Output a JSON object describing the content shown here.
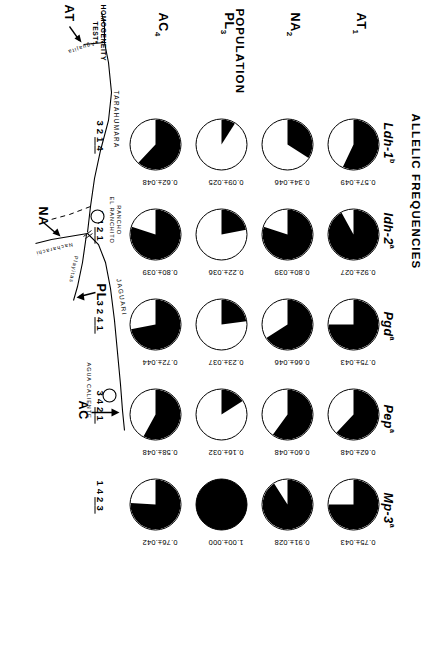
{
  "figure": {
    "allelic_title": "ALLELIC FREQUENCIES",
    "population_title": "POPULATION",
    "homogeneity_label_line1": "HOMOGENEITY",
    "homogeneity_label_line2": "TEST*"
  },
  "loci": [
    {
      "name": "Ldh-1",
      "sup": "b"
    },
    {
      "name": "Idh-2",
      "sup": "a"
    },
    {
      "name": "Pgd",
      "sup": "a"
    },
    {
      "name": "Pep",
      "sup": "a"
    },
    {
      "name": "Mp-3",
      "sup": "a"
    }
  ],
  "populations": [
    {
      "code": "AT",
      "sub": "1"
    },
    {
      "code": "NA",
      "sub": "2"
    },
    {
      "code": "PL",
      "sub": "3"
    },
    {
      "code": "AC",
      "sub": "4"
    }
  ],
  "chart_data": {
    "type": "pie",
    "title": "ALLELIC FREQUENCIES",
    "categories": [
      "Ldh-1 b",
      "Idh-2 a",
      "Pgd a",
      "Pep a",
      "Mp-3 a"
    ],
    "rows": [
      {
        "population": "AT1",
        "cells": [
          {
            "locus": "Ldh-1",
            "value": 0.57,
            "se": 0.049,
            "label": "0.57±.049"
          },
          {
            "locus": "Idh-2",
            "value": 0.92,
            "se": 0.027,
            "label": "0.92±.027"
          },
          {
            "locus": "Pgd",
            "value": 0.75,
            "se": 0.043,
            "label": "0.75±.043"
          },
          {
            "locus": "Pep",
            "value": 0.62,
            "se": 0.048,
            "label": "0.62±.048"
          },
          {
            "locus": "Mp-3",
            "value": 0.75,
            "se": 0.043,
            "label": "0.75±.043"
          }
        ]
      },
      {
        "population": "NA2",
        "cells": [
          {
            "locus": "Ldh-1",
            "value": 0.34,
            "se": 0.046,
            "label": "0.34±.046"
          },
          {
            "locus": "Idh-2",
            "value": 0.8,
            "se": 0.039,
            "label": "0.80±.039"
          },
          {
            "locus": "Pgd",
            "value": 0.66,
            "se": 0.046,
            "label": "0.66±.046"
          },
          {
            "locus": "Pep",
            "value": 0.6,
            "se": 0.048,
            "label": "0.60±.048"
          },
          {
            "locus": "Mp-3",
            "value": 0.91,
            "se": 0.028,
            "label": "0.91±.028"
          }
        ]
      },
      {
        "population": "PL3",
        "cells": [
          {
            "locus": "Ldh-1",
            "value": 0.09,
            "se": 0.025,
            "label": "0.09±.025"
          },
          {
            "locus": "Idh-2",
            "value": 0.22,
            "se": 0.036,
            "label": "0.22±.036"
          },
          {
            "locus": "Pgd",
            "value": 0.23,
            "se": 0.037,
            "label": "0.23±.037"
          },
          {
            "locus": "Pep",
            "value": 0.16,
            "se": 0.032,
            "label": "0.16±.032"
          },
          {
            "locus": "Mp-3",
            "value": 1.0,
            "se": 0.0,
            "label": "1.00±.000"
          }
        ]
      },
      {
        "population": "AC4",
        "cells": [
          {
            "locus": "Ldh-1",
            "value": 0.62,
            "se": 0.048,
            "label": "0.62±.048"
          },
          {
            "locus": "Idh-2",
            "value": 0.8,
            "se": 0.039,
            "label": "0.80±.039"
          },
          {
            "locus": "Pgd",
            "value": 0.72,
            "se": 0.044,
            "label": "0.72±.044"
          },
          {
            "locus": "Pep",
            "value": 0.58,
            "se": 0.048,
            "label": "0.58±.048"
          },
          {
            "locus": "Mp-3",
            "value": 0.76,
            "se": 0.042,
            "label": "0.76±.042"
          }
        ]
      }
    ],
    "homogeneity_ranks": [
      {
        "locus": "Ldh-1",
        "order": [
          "3",
          "2",
          "1",
          "4"
        ],
        "underlined": [
          "1",
          "4"
        ]
      },
      {
        "locus": "Idh-2",
        "order": [
          "3",
          "4",
          "2",
          "1"
        ],
        "underlined": [
          "2",
          "1"
        ]
      },
      {
        "locus": "Pgd",
        "order": [
          "3",
          "2",
          "4",
          "1"
        ],
        "underlined": [
          "4",
          "1"
        ]
      },
      {
        "locus": "Pep",
        "order": [
          "3",
          "4",
          "2",
          "1"
        ],
        "underlined": [
          "2",
          "1"
        ]
      },
      {
        "locus": "Mp-3",
        "order": [
          "1",
          "4",
          "2",
          "3"
        ],
        "underlined": [
          "2",
          "3"
        ]
      }
    ]
  },
  "map": {
    "site_labels": [
      {
        "id": "AT",
        "text": "AT"
      },
      {
        "id": "NA",
        "text": "NA"
      },
      {
        "id": "PL",
        "text": "PL"
      },
      {
        "id": "AC",
        "text": "AC"
      }
    ],
    "river_labels": [
      {
        "id": "tarahumara",
        "text": "TARAHUMARA"
      },
      {
        "id": "jaguari",
        "text": "JAGUARI"
      },
      {
        "id": "aguajita",
        "text": "Aguajita"
      },
      {
        "id": "nacharachi",
        "text": "Nacharachi"
      },
      {
        "id": "playitas",
        "text": "Playitas"
      }
    ],
    "place_labels": [
      {
        "id": "rancho-el-ranchito",
        "line1": "RANCHO",
        "line2": "EL RANCHITO"
      },
      {
        "id": "agua-caliente",
        "text": "AGUA CALIENTE"
      }
    ]
  }
}
